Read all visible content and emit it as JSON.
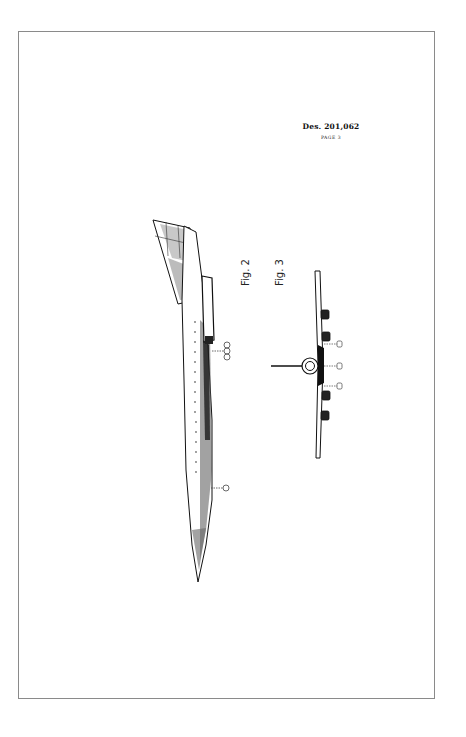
{
  "document": {
    "patent_number": "Des. 201,062",
    "page_label": "PAGE 3"
  },
  "figures": [
    {
      "id": "fig2",
      "label": "Fig. 2",
      "view": "side-elevation-aircraft"
    },
    {
      "id": "fig3",
      "label": "Fig. 3",
      "view": "front-elevation-aircraft"
    }
  ],
  "colors": {
    "border": "#8a8a8a",
    "ink": "#111111",
    "paper": "#ffffff"
  }
}
